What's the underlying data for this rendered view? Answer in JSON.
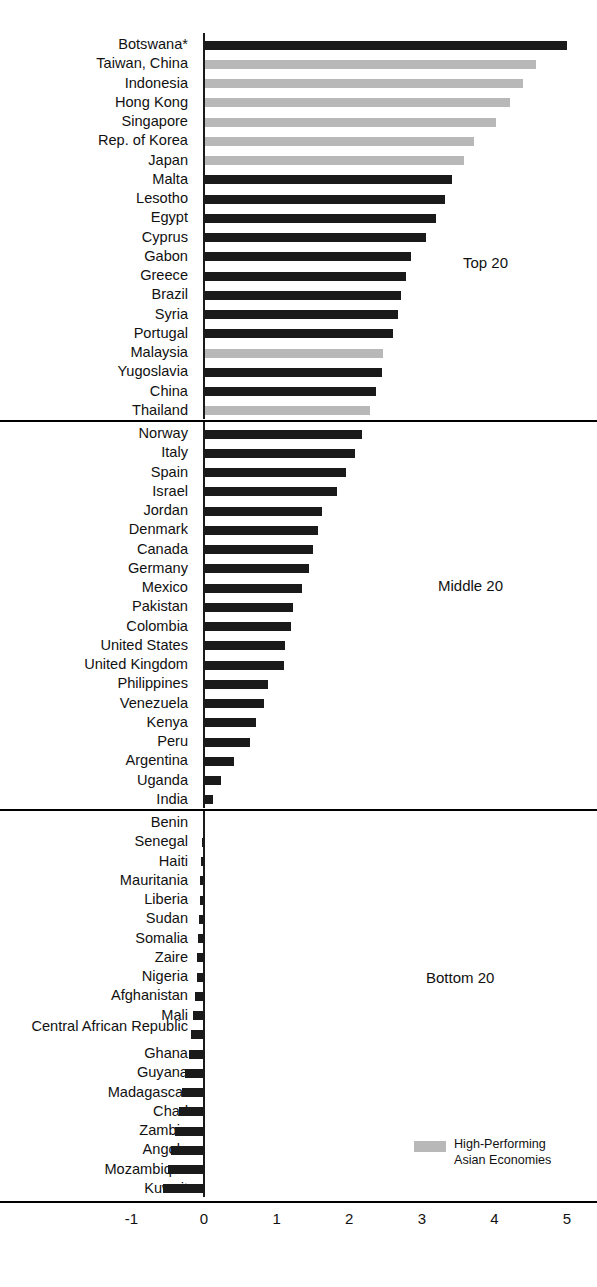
{
  "chart_data": {
    "type": "bar",
    "orientation": "horizontal",
    "title": "",
    "xlabel": "",
    "ylabel": "",
    "xlim": [
      -1,
      5
    ],
    "xticks": [
      -1,
      0,
      1,
      2,
      3,
      4,
      5
    ],
    "xticklabels": [
      "-1",
      "0",
      "1",
      "2",
      "3",
      "4",
      "5"
    ],
    "grid": false,
    "legend": {
      "position": "bottom-right",
      "entries": [
        {
          "label_line1": "High-Performing",
          "label_line2": "Asian Economies",
          "color": "#b8b8b8"
        }
      ]
    },
    "series_colors": {
      "default": "#1a1a1a",
      "highlight": "#b8b8b8"
    },
    "groups": [
      {
        "name": "Top 20",
        "annotation": "Top 20",
        "categories": [
          "Botswana*",
          "Taiwan, China",
          "Indonesia",
          "Hong Kong",
          "Singapore",
          "Rep. of Korea",
          "Japan",
          "Malta",
          "Lesotho",
          "Egypt",
          "Cyprus",
          "Gabon",
          "Greece",
          "Brazil",
          "Syria",
          "Portugal",
          "Malaysia",
          "Yugoslavia",
          "China",
          "Thailand"
        ],
        "values": [
          5.0,
          4.57,
          4.4,
          4.22,
          4.02,
          3.72,
          3.58,
          3.42,
          3.32,
          3.2,
          3.06,
          2.85,
          2.78,
          2.72,
          2.67,
          2.6,
          2.47,
          2.45,
          2.37,
          2.28
        ],
        "highlight": [
          false,
          true,
          true,
          true,
          true,
          true,
          true,
          false,
          false,
          false,
          false,
          false,
          false,
          false,
          false,
          false,
          true,
          false,
          false,
          true
        ]
      },
      {
        "name": "Middle 20",
        "annotation": "Middle 20",
        "categories": [
          "Norway",
          "Italy",
          "Spain",
          "Israel",
          "Jordan",
          "Denmark",
          "Canada",
          "Germany",
          "Mexico",
          "Pakistan",
          "Colombia",
          "United States",
          "United Kingdom",
          "Philippines",
          "Venezuela",
          "Kenya",
          "Peru",
          "Argentina",
          "Uganda",
          "India"
        ],
        "values": [
          2.18,
          2.08,
          1.95,
          1.83,
          1.62,
          1.57,
          1.5,
          1.45,
          1.35,
          1.22,
          1.2,
          1.12,
          1.1,
          0.88,
          0.83,
          0.72,
          0.63,
          0.42,
          0.23,
          0.12
        ],
        "highlight": [
          false,
          false,
          false,
          false,
          false,
          false,
          false,
          false,
          false,
          false,
          false,
          false,
          false,
          false,
          false,
          false,
          false,
          false,
          false,
          false
        ]
      },
      {
        "name": "Bottom 20",
        "annotation": "Bottom 20",
        "categories": [
          "Benin",
          "Senegal",
          "Haiti",
          "Mauritania",
          "Liberia",
          "Sudan",
          "Somalia",
          "Zaire",
          "Nigeria",
          "Afghanistan",
          "Mali",
          "Central African Republic",
          "Ghana",
          "Guyana",
          "Madagascar",
          "Chad",
          "Zambia",
          "Angola",
          "Mozambique",
          "Kuwait"
        ],
        "values": [
          -0.02,
          -0.03,
          -0.04,
          -0.05,
          -0.06,
          -0.07,
          -0.08,
          -0.09,
          -0.1,
          -0.12,
          -0.15,
          -0.18,
          -0.21,
          -0.26,
          -0.3,
          -0.34,
          -0.4,
          -0.45,
          -0.5,
          -0.57
        ],
        "highlight": [
          false,
          false,
          false,
          false,
          false,
          false,
          false,
          false,
          false,
          false,
          false,
          false,
          false,
          false,
          false,
          false,
          false,
          false,
          false,
          false
        ]
      }
    ]
  }
}
